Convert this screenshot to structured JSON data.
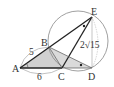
{
  "diagram": {
    "type": "geometry",
    "points": {
      "A": {
        "label": "A",
        "x": 20,
        "y": 68
      },
      "B": {
        "label": "B",
        "x": 49,
        "y": 47
      },
      "C": {
        "label": "C",
        "x": 62,
        "y": 68
      },
      "D": {
        "label": "D",
        "x": 92,
        "y": 68
      },
      "E": {
        "label": "E",
        "x": 92,
        "y": 17
      }
    },
    "circle": {
      "cx": 78,
      "cy": 41,
      "r": 30,
      "passes_through": [
        "B",
        "C",
        "D",
        "E"
      ]
    },
    "labels": {
      "A": "A",
      "B": "B",
      "C": "C",
      "D": "D",
      "E": "E",
      "AB": "5",
      "AC": "6",
      "CE": "2√15"
    },
    "shaded_triangles": [
      "ABC",
      "BCD"
    ],
    "angle_marks": {
      "A": "circle",
      "E": "dot",
      "D": "dot"
    },
    "colors": {
      "line": "#222222",
      "shade": "#cfcfcf",
      "circle": "#777777"
    }
  }
}
